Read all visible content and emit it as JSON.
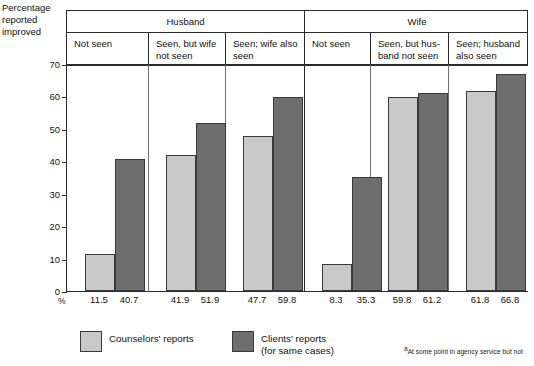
{
  "axis_title": "Percentage\nreported\nimproved",
  "percent_sign": "%",
  "header": {
    "top": [
      {
        "label": "Husband"
      },
      {
        "label": "Wife"
      }
    ],
    "bottom": [
      {
        "label": "Not seen"
      },
      {
        "label": "Seen, but wife not seen"
      },
      {
        "label": "Seen; wife also seen"
      },
      {
        "label": "Not seen"
      },
      {
        "label": "Seen, but hus-band not seen"
      },
      {
        "label": "Seen; husband also seen"
      }
    ]
  },
  "legend": [
    {
      "label": "Counselors' reports",
      "color": "#c9c9c9",
      "swatch": "light"
    },
    {
      "label": "Clients' reports\n(for same cases)",
      "color": "#6e6e6e",
      "swatch": "dark"
    }
  ],
  "footnote": {
    "mark": "a",
    "text": "At some point in agency service but not"
  },
  "chart_data": {
    "type": "bar",
    "title": "",
    "xlabel": "",
    "ylabel": "Percentage reported improved",
    "ylim": [
      0,
      70
    ],
    "yticks": [
      0,
      10,
      20,
      30,
      40,
      50,
      60,
      70
    ],
    "ytick_labels": [
      "0",
      "10",
      "20",
      "30",
      "40",
      "50",
      "60",
      "70"
    ],
    "grid": false,
    "legend_position": "bottom",
    "supergroups": [
      "Husband",
      "Wife"
    ],
    "categories": [
      "Not seen",
      "Seen, but wife not seen",
      "Seen; wife also seen",
      "Not seen",
      "Seen, but husband not seen",
      "Seen; husband also seen"
    ],
    "series": [
      {
        "name": "Counselors' reports",
        "color": "#c9c9c9",
        "values": [
          11.5,
          41.9,
          47.7,
          8.3,
          59.8,
          61.8
        ]
      },
      {
        "name": "Clients' reports (for same cases)",
        "color": "#6e6e6e",
        "values": [
          40.7,
          51.9,
          59.8,
          35.3,
          61.2,
          66.8
        ]
      }
    ],
    "value_labels": [
      "11.5",
      "40.7",
      "41.9",
      "51.9",
      "47.7",
      "59.8",
      "8.3",
      "35.3",
      "59.8",
      "61.2",
      "61.8",
      "66.8"
    ]
  }
}
